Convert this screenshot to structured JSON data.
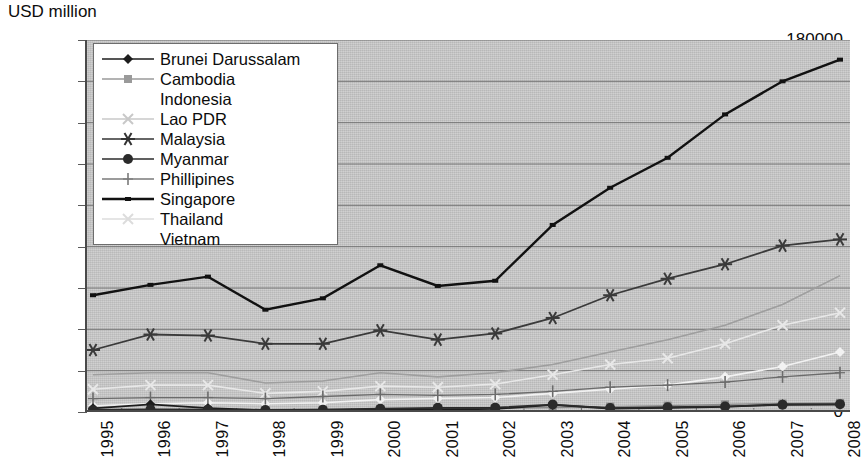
{
  "chart_data": {
    "type": "line",
    "title": "",
    "ylabel": "USD million",
    "xlabel": "",
    "ylim": [
      0,
      180000
    ],
    "ytick_labels": [
      "0",
      "20000",
      "40000",
      "60000",
      "80000",
      "100000",
      "120000",
      "140000",
      "160000",
      "180000"
    ],
    "ytick_values": [
      0,
      20000,
      40000,
      60000,
      80000,
      100000,
      120000,
      140000,
      160000,
      180000
    ],
    "grid": true,
    "legend_position": "top-left",
    "categories": [
      "1995",
      "1996",
      "1997",
      "1998",
      "1999",
      "2000",
      "2001",
      "2002",
      "2003",
      "2004",
      "2005",
      "2006",
      "2007",
      "2008"
    ],
    "series": [
      {
        "name": "Brunei Darussalam",
        "marker": "diamond",
        "color": "#1d1d1d",
        "width": 1.8,
        "values": [
          1800,
          3700,
          1900,
          900,
          900,
          1300,
          1200,
          1500,
          3400,
          1700,
          2000,
          2500,
          3700,
          3600
        ]
      },
      {
        "name": "Cambodia",
        "marker": "square",
        "color": "#8c8c8c",
        "width": 1.4,
        "values": [
          900,
          1000,
          1000,
          1000,
          1200,
          1400,
          1600,
          1800,
          2200,
          2600,
          3100,
          3700,
          4100,
          4400
        ]
      },
      {
        "name": "Indonesia",
        "marker": "none",
        "color": "#9e9e9e",
        "width": 1.6,
        "values": [
          18000,
          19000,
          19000,
          14000,
          15000,
          19000,
          17000,
          19000,
          23000,
          29000,
          35000,
          42000,
          52000,
          66000
        ]
      },
      {
        "name": "Lao PDR",
        "marker": "x",
        "color": "#c3c3c3",
        "width": 1.2,
        "values": [
          400,
          400,
          400,
          400,
          400,
          400,
          400,
          400,
          500,
          500,
          600,
          800,
          1000,
          1100
        ]
      },
      {
        "name": "Malaysia",
        "marker": "asterisk",
        "color": "#3a3a3a",
        "width": 1.8,
        "values": [
          30000,
          37500,
          37000,
          33000,
          33000,
          39500,
          35000,
          38000,
          45500,
          56500,
          64500,
          71500,
          80500,
          83500
        ]
      },
      {
        "name": "Myanmar",
        "marker": "circle",
        "color": "#2b2b2b",
        "width": 1.8,
        "values": [
          1000,
          1200,
          1100,
          1000,
          1100,
          1600,
          2000,
          2100,
          3600,
          1900,
          2300,
          2700,
          3500,
          3800
        ]
      },
      {
        "name": "Phillipines",
        "marker": "plus",
        "color": "#6b6b6b",
        "width": 1.3,
        "values": [
          6500,
          7000,
          7000,
          6500,
          7500,
          8500,
          8000,
          8500,
          10000,
          12000,
          13000,
          14500,
          17000,
          19000
        ]
      },
      {
        "name": "Singapore",
        "marker": "tick",
        "color": "#111111",
        "width": 2.4,
        "values": [
          56500,
          61500,
          65500,
          49500,
          55000,
          71000,
          61000,
          63500,
          90500,
          108500,
          123000,
          144000,
          160000,
          170500
        ]
      },
      {
        "name": "Thailand",
        "marker": "x",
        "color": "#e8e8e8",
        "width": 1.6,
        "values": [
          11000,
          13000,
          13000,
          9000,
          10000,
          12500,
          12000,
          13500,
          18000,
          23000,
          26000,
          33000,
          42000,
          48000
        ]
      },
      {
        "name": "Vietnam",
        "marker": "diamond",
        "color": "#f2f2f2",
        "width": 1.6,
        "values": [
          3000,
          4000,
          4500,
          4000,
          4500,
          6000,
          6500,
          7000,
          9000,
          11000,
          13000,
          17000,
          22000,
          29000
        ]
      }
    ]
  },
  "legend": {
    "items": [
      {
        "label": "Brunei Darussalam",
        "marker": "diamond"
      },
      {
        "label": "Cambodia",
        "marker": "square"
      },
      {
        "label": "Indonesia",
        "marker": "none"
      },
      {
        "label": "Lao PDR",
        "marker": "x"
      },
      {
        "label": "Malaysia",
        "marker": "asterisk"
      },
      {
        "label": "Myanmar",
        "marker": "circle"
      },
      {
        "label": "Phillipines",
        "marker": "plus"
      },
      {
        "label": "Singapore",
        "marker": "tick"
      },
      {
        "label": "Thailand",
        "marker": "xfaint"
      },
      {
        "label": "Vietnam",
        "marker": "none"
      }
    ]
  },
  "colors": {
    "plot_background": "#c9c9c9",
    "axis": "#4a4a4a",
    "gridline": "#6e6e6e",
    "text": "#0d0d0d"
  }
}
